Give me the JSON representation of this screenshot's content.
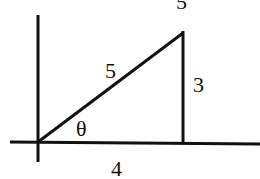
{
  "diagram": {
    "labels": {
      "hypotenuse": "5",
      "opposite": "3",
      "adjacent": "4",
      "angle": "θ",
      "top_cut": "5"
    },
    "colors": {
      "stroke": "#111111",
      "background": "#ffffff"
    }
  }
}
